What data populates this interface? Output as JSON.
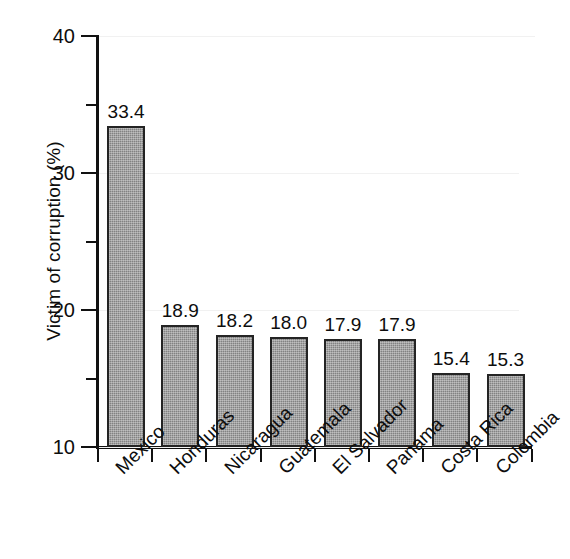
{
  "chart_data": {
    "type": "bar",
    "title": "",
    "xlabel": "",
    "ylabel": "Victim of corruption (%)",
    "categories": [
      "Mexico",
      "Honduras",
      "Nicaragua",
      "Guatemala",
      "El Salvador",
      "Panama",
      "Costa Rica",
      "Colombia"
    ],
    "values": [
      33.4,
      18.9,
      18.2,
      18.0,
      17.9,
      17.9,
      15.4,
      15.3
    ],
    "value_labels": [
      "33.4",
      "18.9",
      "18.2",
      "18.0",
      "17.9",
      "17.9",
      "15.4",
      "15.3"
    ],
    "ylim": [
      10,
      40
    ],
    "y_major_ticks": [
      10,
      20,
      30,
      40
    ],
    "y_major_tick_labels": [
      "10",
      "20",
      "30",
      "40"
    ],
    "y_minor_ticks": [
      15,
      25,
      35
    ],
    "grid": "faint-horizontal",
    "legend": "none",
    "bar_color": "#828282",
    "bar_edge_color": "#242424",
    "axis_color": "#111111",
    "text_color": "#0d0d0d",
    "background_color": "#ffffff",
    "xtick_label_rotation": -45
  }
}
